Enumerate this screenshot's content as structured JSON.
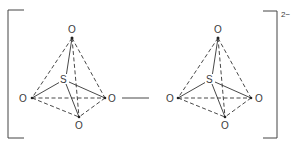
{
  "diagram": {
    "title": "",
    "charge": "2−",
    "tetrahedra": [
      {
        "center": {
          "label": "S",
          "x": 64,
          "y": 80
        },
        "vertices": {
          "top": {
            "label": "O",
            "x": 72,
            "y": 38,
            "lx": 71,
            "ly": 32
          },
          "left": {
            "label": "O",
            "x": 32,
            "y": 98,
            "lx": 24,
            "ly": 101
          },
          "right": {
            "label": "O",
            "x": 105,
            "y": 98,
            "lx": 112,
            "ly": 101
          },
          "bottom": {
            "label": "O",
            "x": 79,
            "y": 117,
            "lx": 78,
            "ly": 129
          }
        }
      },
      {
        "center": {
          "label": "S",
          "x": 210,
          "y": 80
        },
        "vertices": {
          "top": {
            "label": "O",
            "x": 218,
            "y": 38,
            "lx": 218,
            "ly": 32
          },
          "left": {
            "label": "O",
            "x": 178,
            "y": 98,
            "lx": 170,
            "ly": 101
          },
          "right": {
            "label": "O",
            "x": 251,
            "y": 98,
            "lx": 258,
            "ly": 101
          },
          "bottom": {
            "label": "O",
            "x": 225,
            "y": 117,
            "lx": 225,
            "ly": 129
          }
        }
      }
    ],
    "bridge": {
      "from": "O",
      "to": "O",
      "style": "solid"
    },
    "colors": {
      "line": "#333333",
      "text": "#3a3a3a",
      "background": "#ffffff"
    }
  }
}
